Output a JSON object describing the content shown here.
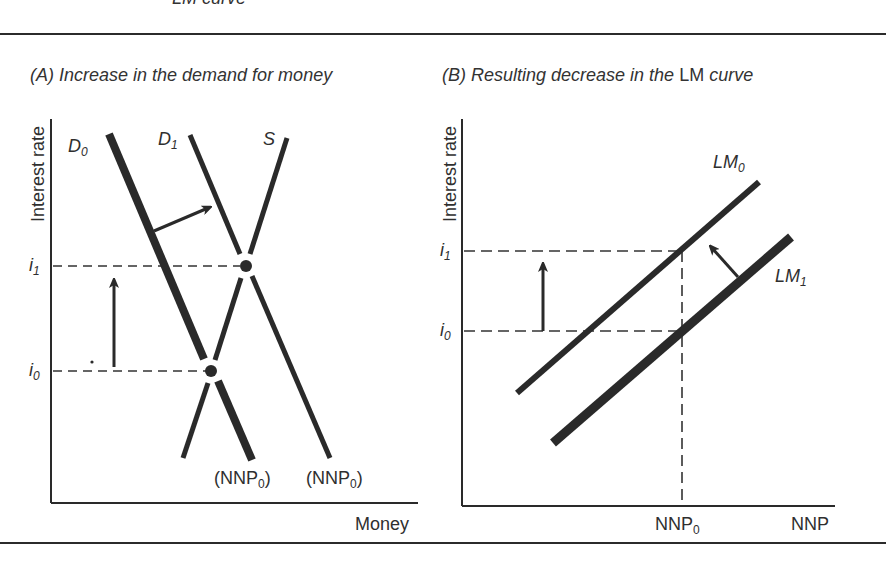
{
  "header": {
    "cutoff_caption": "LM curve"
  },
  "panels": {
    "a": {
      "title_prefix": "(A) Increase in the demand for money",
      "y_axis_label": "Interest rate",
      "x_axis_label": "Money",
      "curves": {
        "d0": {
          "name": "D",
          "sub": "0"
        },
        "d1": {
          "name": "D",
          "sub": "1"
        },
        "s": {
          "name": "S"
        }
      },
      "ticks": {
        "i1": {
          "name": "i",
          "sub": "1"
        },
        "i0": {
          "name": "i",
          "sub": "0"
        }
      },
      "bottom_labels": [
        {
          "text": "(NNP",
          "sub": "0",
          "close": ")"
        },
        {
          "text": "(NNP",
          "sub": "0",
          "close": ")"
        }
      ]
    },
    "b": {
      "title_italic_1": "(B) Resulting decrease in the ",
      "title_upright": "LM",
      "title_italic_2": " curve",
      "y_axis_label": "Interest rate",
      "x_axis_label": "NNP",
      "curves": {
        "lm0": {
          "name": "LM",
          "sub": "0"
        },
        "lm1": {
          "name": "LM",
          "sub": "1"
        }
      },
      "ticks": {
        "i1": {
          "name": "i",
          "sub": "1"
        },
        "i0": {
          "name": "i",
          "sub": "0"
        },
        "nnp0": {
          "name": "NNP",
          "sub": "0"
        }
      }
    }
  },
  "colors": {
    "ink": "#2a2a2a",
    "background": "#ffffff"
  }
}
